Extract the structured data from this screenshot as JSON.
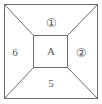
{
  "figure": {
    "background_color": "#ffffff",
    "line_color": "#6b6b6b",
    "label_color": "#555555",
    "outer_square": {
      "x": 4,
      "y": 4,
      "width": 94,
      "height": 95
    },
    "inner_rect": {
      "x": 33,
      "y": 35,
      "width": 35,
      "height": 33
    },
    "diagonals": [
      {
        "name": "top-left-diagonal",
        "from": [
          4,
          4
        ],
        "to": [
          33,
          35
        ]
      },
      {
        "name": "top-right-diagonal",
        "from": [
          98,
          4
        ],
        "to": [
          68,
          35
        ]
      },
      {
        "name": "bottom-right-diagonal",
        "from": [
          98,
          99
        ],
        "to": [
          68,
          68
        ]
      },
      {
        "name": "bottom-left-diagonal",
        "from": [
          4,
          99
        ],
        "to": [
          33,
          68
        ]
      }
    ],
    "labels": {
      "center": "A",
      "top": "①",
      "right": "②",
      "bottom": "5",
      "left": "6"
    },
    "regions": [
      {
        "name": "center",
        "label": "A",
        "circled": false
      },
      {
        "name": "top-trapezoid",
        "label": "①",
        "circled": true
      },
      {
        "name": "right-trapezoid",
        "label": "②",
        "circled": true
      },
      {
        "name": "bottom-trapezoid",
        "label": "5",
        "circled": false
      },
      {
        "name": "left-trapezoid",
        "label": "6",
        "circled": false
      }
    ]
  }
}
